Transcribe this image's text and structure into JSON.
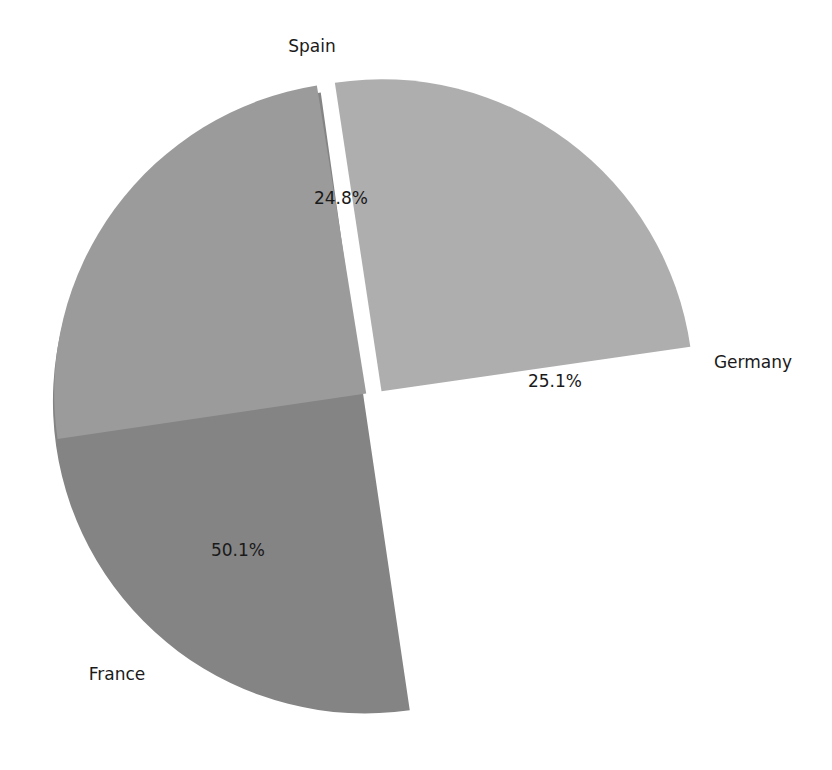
{
  "chart_data": {
    "type": "pie",
    "title": "",
    "subtitle": "",
    "xlabel": "",
    "ylabel": "",
    "grid": false,
    "legend": "none",
    "exploded": true,
    "labels_position": "outside",
    "autopct_format": "%.1f%%",
    "categories": [
      "France",
      "Germany",
      "Spain"
    ],
    "values": [
      50.1,
      25.1,
      24.8
    ],
    "percent_labels": [
      "50.1%",
      "25.1%",
      "24.8%"
    ],
    "colors": [
      "#848484",
      "#aeaeae",
      "#9b9b9b"
    ],
    "background_color": "#ffffff",
    "text_color": "#1a1a1a",
    "slices": [
      {
        "name": "France",
        "label": "France",
        "percent_label": "50.1%",
        "value": 50.1,
        "color": "#848484",
        "start_angle_deg": 98,
        "end_angle_deg": 278.4,
        "explode": 0.035,
        "label_x": 117,
        "label_y": 675,
        "pct_x": 238,
        "pct_y": 551
      },
      {
        "name": "Germany",
        "label": "Germany",
        "percent_label": "25.1%",
        "value": 25.1,
        "color": "#aeaeae",
        "start_angle_deg": 8.2,
        "end_angle_deg": 98.6,
        "explode": 0.035,
        "label_x": 753,
        "label_y": 363,
        "pct_x": 555,
        "pct_y": 382
      },
      {
        "name": "Spain",
        "label": "Spain",
        "percent_label": "24.8%",
        "value": 24.8,
        "color": "#9b9b9b",
        "start_angle_deg": 99.1,
        "end_angle_deg": 188.4,
        "explode": 0.035,
        "label_x": 312,
        "label_y": 47,
        "pct_x": 341,
        "pct_y": 199
      }
    ],
    "geometry": {
      "center_x": 375,
      "center_y": 400,
      "radius": 312
    }
  }
}
